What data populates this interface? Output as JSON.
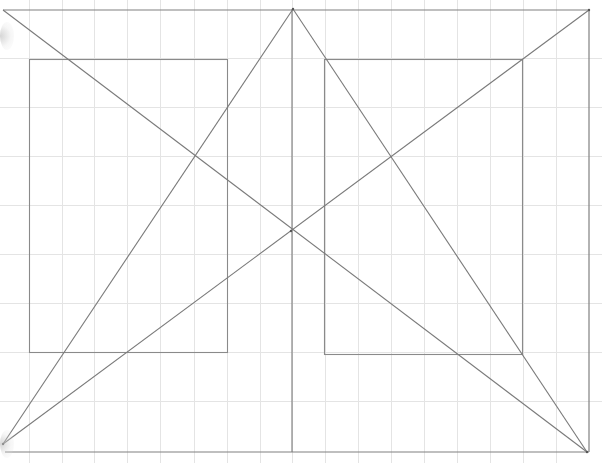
{
  "canvas": {
    "width": 602,
    "height": 463,
    "background": "#ffffff"
  },
  "colors": {
    "grid": "#e4e4e4",
    "frame": "#808080",
    "construction": "#7a7a7a",
    "inner_rect": "#8a8a8a"
  },
  "grid": {
    "vertical_x": [
      29,
      62,
      94,
      127,
      160,
      194,
      227,
      260,
      292,
      325,
      358,
      391,
      424,
      457,
      490,
      523,
      556
    ],
    "horizontal_y": [
      58,
      107,
      156,
      205,
      254,
      303,
      352,
      401
    ],
    "extends_top": 0,
    "extends_bottom": 463,
    "extends_left": 0,
    "extends_right": 602
  },
  "outer_frame": {
    "top_y": 10,
    "bottom_y": 452,
    "left_x": 3,
    "right_x": 589
  },
  "inner_rects": [
    {
      "name": "left-inner-rect",
      "x": 29,
      "y": 59,
      "width": 198,
      "height": 293
    },
    {
      "name": "right-inner-rect",
      "x": 324,
      "y": 59,
      "width": 198,
      "height": 295
    }
  ],
  "construction_lines": [
    {
      "name": "diagonal-topleft-to-bottomright",
      "x1": 3,
      "y1": 10,
      "x2": 587,
      "y2": 452
    },
    {
      "name": "diagonal-bottomleft-to-topright",
      "x1": 3,
      "y1": 444,
      "x2": 589,
      "y2": 10
    },
    {
      "name": "apex-to-bottomleft",
      "x1": 293,
      "y1": 9,
      "x2": 3,
      "y2": 444
    },
    {
      "name": "apex-to-bottomright",
      "x1": 293,
      "y1": 9,
      "x2": 587,
      "y2": 452
    },
    {
      "name": "center-vertical",
      "x1": 292,
      "y1": 9,
      "x2": 292,
      "y2": 452
    }
  ],
  "key_points": {
    "apex": {
      "x": 293,
      "y": 9
    },
    "center_intersection": {
      "x": 291,
      "y": 231
    },
    "bottom_left_vertex": {
      "x": 3,
      "y": 444
    },
    "bottom_right_vertex": {
      "x": 587,
      "y": 452
    },
    "top_right_vertex": {
      "x": 589,
      "y": 10
    }
  },
  "vignettes": [
    {
      "top": 22
    },
    {
      "top": 430
    }
  ]
}
